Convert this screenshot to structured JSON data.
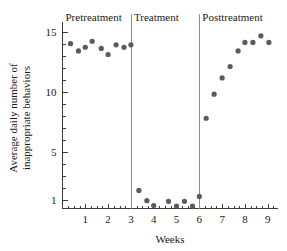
{
  "chart_data": {
    "type": "scatter",
    "title": "",
    "xlabel": "Weeks",
    "ylabel": "Average daily number of inappropriate behaviors",
    "xlim": [
      0,
      9.45
    ],
    "ylim": [
      0.3,
      15.8
    ],
    "grid": false,
    "legend": null,
    "y_ticks": [
      1,
      5,
      10,
      15
    ],
    "y_tick_labels": [
      "1",
      "5",
      "10",
      "15"
    ],
    "x_ticks": [
      1,
      2,
      3,
      4,
      5,
      6,
      7,
      8,
      9
    ],
    "x_tick_labels": [
      "1",
      "2",
      "3",
      "4",
      "5",
      "6",
      "7",
      "8",
      "9"
    ],
    "x_minor_step": 0.25,
    "y_minor_step": 1,
    "phases": [
      {
        "label": "Pretreatment",
        "start": 0.0,
        "end": 3.0
      },
      {
        "label": "Treatment",
        "start": 3.0,
        "end": 6.0
      },
      {
        "label": "Posttreatment",
        "start": 6.0,
        "end": 9.45
      }
    ],
    "phase_dividers": [
      3.0,
      6.0
    ],
    "marker": {
      "shape": "circle",
      "radius": 2.6,
      "color": "#5a5a5f"
    },
    "series": [
      {
        "name": "Average daily inappropriate behaviors",
        "points": [
          {
            "x": 0.35,
            "y": 14.0
          },
          {
            "x": 0.7,
            "y": 13.4
          },
          {
            "x": 1.0,
            "y": 13.7
          },
          {
            "x": 1.3,
            "y": 14.2
          },
          {
            "x": 1.7,
            "y": 13.6
          },
          {
            "x": 2.0,
            "y": 13.1
          },
          {
            "x": 2.35,
            "y": 13.9
          },
          {
            "x": 2.7,
            "y": 13.7
          },
          {
            "x": 3.0,
            "y": 13.9
          },
          {
            "x": 3.35,
            "y": 1.8
          },
          {
            "x": 3.7,
            "y": 0.95
          },
          {
            "x": 4.0,
            "y": 0.55
          },
          {
            "x": 4.65,
            "y": 0.9
          },
          {
            "x": 5.0,
            "y": 0.5
          },
          {
            "x": 5.35,
            "y": 0.9
          },
          {
            "x": 5.7,
            "y": 0.5
          },
          {
            "x": 6.0,
            "y": 1.3
          },
          {
            "x": 6.3,
            "y": 7.8
          },
          {
            "x": 6.65,
            "y": 9.8
          },
          {
            "x": 7.0,
            "y": 11.15
          },
          {
            "x": 7.35,
            "y": 12.1
          },
          {
            "x": 7.7,
            "y": 13.4
          },
          {
            "x": 8.0,
            "y": 14.1
          },
          {
            "x": 8.35,
            "y": 14.1
          },
          {
            "x": 8.7,
            "y": 14.65
          },
          {
            "x": 9.05,
            "y": 14.1
          }
        ]
      }
    ]
  }
}
